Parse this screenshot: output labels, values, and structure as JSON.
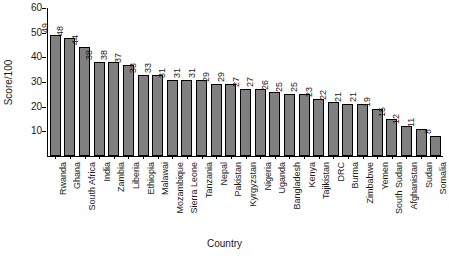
{
  "chart_data": {
    "type": "bar",
    "title": "",
    "xlabel": "Country",
    "ylabel": "Score/100",
    "ylim": [
      0,
      60
    ],
    "yticks": [
      10,
      20,
      30,
      40,
      50,
      60
    ],
    "grid": false,
    "legend": null,
    "bar_color": "#808080",
    "bar_edge_color": "#000000",
    "categories": [
      "Rwanda",
      "Ghana",
      "South Africa",
      "India",
      "Zambia",
      "Liberia",
      "Ethiopia",
      "Malawai",
      "Mozambique",
      "Sierra Leone",
      "Tanzania",
      "Nepal",
      "Pakistan",
      "Kyrgyzstan",
      "Nigeria",
      "Uganda",
      "Bangladesh",
      "Kenya",
      "Tajikistan",
      "DRC",
      "Burma",
      "Zimbabwe",
      "Yemen",
      "South Sudan",
      "Afghanistan",
      "Sudan",
      "Somalia"
    ],
    "values": [
      49,
      48,
      44,
      38,
      38,
      37,
      33,
      33,
      31,
      31,
      31,
      29,
      29,
      27,
      27,
      26,
      25,
      25,
      23,
      22,
      21,
      21,
      19,
      15,
      12,
      11,
      8
    ],
    "data_labels": [
      "49",
      "48",
      "44",
      "38",
      "38",
      "37",
      "33",
      "33",
      "31",
      "31",
      "31",
      "29",
      "29",
      "27",
      "27",
      "26",
      "25",
      "25",
      "23",
      "22",
      "21",
      "21",
      "19",
      "15",
      "12",
      "11",
      "8"
    ]
  }
}
